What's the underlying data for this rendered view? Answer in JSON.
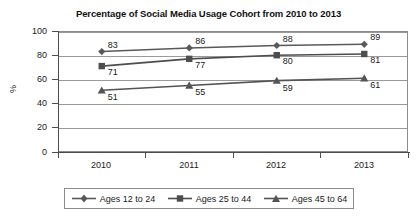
{
  "chart_data": {
    "type": "line",
    "title": "Percentage of Social Media Usage Cohort from 2010 to 2013",
    "xlabel": "",
    "ylabel": "%",
    "categories": [
      "2010",
      "2011",
      "2012",
      "2013"
    ],
    "ylim": [
      0,
      100
    ],
    "yticks": [
      0,
      20,
      40,
      60,
      80,
      100
    ],
    "ytick_labels": [
      "0",
      "20",
      "40",
      "60",
      "80",
      "100"
    ],
    "grid": true,
    "legend_position": "bottom",
    "series": [
      {
        "name": "Ages 12 to 24",
        "marker": "diamond",
        "color": "#595959",
        "values": [
          83,
          86,
          88,
          89
        ],
        "value_labels": [
          "83",
          "86",
          "88",
          "89"
        ]
      },
      {
        "name": "Ages 25 to 44",
        "marker": "square",
        "color": "#4d4d4d",
        "values": [
          71,
          77,
          80,
          81
        ],
        "value_labels": [
          "71",
          "77",
          "80",
          "81"
        ]
      },
      {
        "name": "Ages 45 to 64",
        "marker": "triangle",
        "color": "#545454",
        "values": [
          51,
          55,
          59,
          61
        ],
        "value_labels": [
          "51",
          "55",
          "59",
          "61"
        ]
      }
    ]
  },
  "colors": {
    "axis": "#4d4d4d",
    "grid": "#9a9a9a",
    "frame": "#8c8c8c",
    "text": "#1a1a1a",
    "background": "#ffffff"
  }
}
